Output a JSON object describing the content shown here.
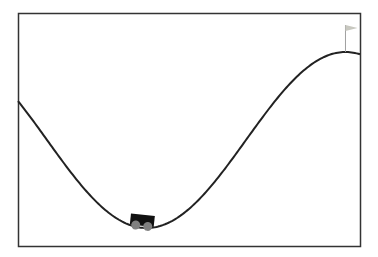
{
  "environment": {
    "name": "Mountain Car",
    "min_position": -1.2,
    "max_position": 0.6,
    "goal_position": 0.5236,
    "car_position": -0.55
  },
  "colors": {
    "background": "#ffffff",
    "frame": "#333333",
    "track": "#222222",
    "car_body": "#111111",
    "wheels": "#808080",
    "flag_pole": "#a0a0a0",
    "flag": "#c8c8c0"
  },
  "viewport": {
    "frame": {
      "x": 18,
      "y": 13,
      "width": 342,
      "height": 233
    }
  }
}
